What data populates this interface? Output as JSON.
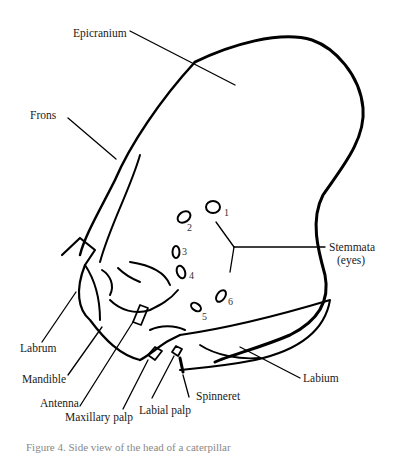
{
  "figure": {
    "caption": "Figure 4. Side view of the head of a caterpillar"
  },
  "labels": {
    "epicranium": "Epicranium",
    "frons": "Frons",
    "stemmata_line1": "Stemmata",
    "stemmata_line2": "(eyes)",
    "labrum": "Labrum",
    "mandible": "Mandible",
    "antenna": "Antenna",
    "maxillary_palp": "Maxillary palp",
    "labial_palp": "Labial palp",
    "spinneret": "Spinneret",
    "labium": "Labium"
  },
  "stemmata_numbers": [
    "1",
    "2",
    "3",
    "4",
    "5",
    "6"
  ],
  "colors": {
    "ink": "#000000",
    "background": "#ffffff"
  }
}
